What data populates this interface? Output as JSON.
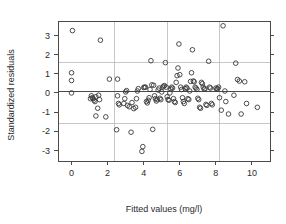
{
  "chart_data": {
    "type": "scatter",
    "title": "",
    "xlabel": "Fitted values (mg/l)",
    "ylabel": "Standardized residuals",
    "xlim": [
      -0.75,
      11.0
    ],
    "ylim": [
      -3.55,
      3.75
    ],
    "xticks": [
      0,
      2,
      4,
      6,
      8,
      10
    ],
    "xtick_labels": [
      "0",
      "2",
      "4",
      "6",
      "8",
      "10"
    ],
    "yticks": [
      -3,
      -2,
      -1,
      0,
      1,
      2,
      3
    ],
    "ytick_labels": [
      "-3",
      "-2",
      "-1",
      "0",
      "1",
      "2",
      "3"
    ],
    "grid": true,
    "grid_color": "#b9b9b9",
    "grid_x": [
      2.4,
      5.3,
      8.2
    ],
    "grid_y": [
      -1.6,
      1.6
    ],
    "reference_line": {
      "y": 0.1,
      "color": "#4a4a4a"
    },
    "marker": "open-circle",
    "marker_color": "#3a3a3a",
    "legend": null,
    "points": [
      [
        0.05,
        3.25
      ],
      [
        0.0,
        1.05
      ],
      [
        0.0,
        0.65
      ],
      [
        0.0,
        0.0
      ],
      [
        1.6,
        2.75
      ],
      [
        1.1,
        -0.15
      ],
      [
        1.15,
        -0.25
      ],
      [
        1.2,
        -0.3
      ],
      [
        1.25,
        -0.38
      ],
      [
        1.3,
        -0.45
      ],
      [
        1.05,
        -0.3
      ],
      [
        1.35,
        -0.2
      ],
      [
        1.5,
        -0.12
      ],
      [
        1.55,
        -0.35
      ],
      [
        1.45,
        -0.8
      ],
      [
        1.35,
        -1.2
      ],
      [
        1.9,
        -1.25
      ],
      [
        2.1,
        0.72
      ],
      [
        2.55,
        0.72
      ],
      [
        2.5,
        -1.92
      ],
      [
        2.55,
        -0.15
      ],
      [
        2.6,
        -0.55
      ],
      [
        2.65,
        -0.62
      ],
      [
        2.9,
        -0.55
      ],
      [
        2.95,
        -0.3
      ],
      [
        3.0,
        0.05
      ],
      [
        3.05,
        0.12
      ],
      [
        3.1,
        -0.65
      ],
      [
        3.2,
        -0.72
      ],
      [
        3.3,
        -2.05
      ],
      [
        3.35,
        -0.5
      ],
      [
        3.45,
        -0.82
      ],
      [
        3.55,
        -0.75
      ],
      [
        3.6,
        -0.3
      ],
      [
        3.65,
        0.1
      ],
      [
        3.7,
        0.22
      ],
      [
        3.9,
        -3.05
      ],
      [
        3.95,
        -2.8
      ],
      [
        4.0,
        0.28
      ],
      [
        4.05,
        0.3
      ],
      [
        4.1,
        0.3
      ],
      [
        4.15,
        -0.45
      ],
      [
        4.2,
        -0.52
      ],
      [
        4.25,
        -0.38
      ],
      [
        4.3,
        -0.25
      ],
      [
        4.35,
        0.18
      ],
      [
        4.4,
        1.68
      ],
      [
        4.45,
        0.42
      ],
      [
        4.5,
        -1.9
      ],
      [
        4.55,
        0.4
      ],
      [
        4.6,
        -0.15
      ],
      [
        4.65,
        -0.3
      ],
      [
        4.7,
        -0.42
      ],
      [
        4.75,
        -0.35
      ],
      [
        4.8,
        0.15
      ],
      [
        4.85,
        0.25
      ],
      [
        4.9,
        -0.28
      ],
      [
        4.95,
        -0.35
      ],
      [
        5.0,
        0.05
      ],
      [
        5.05,
        0.3
      ],
      [
        5.1,
        0.35
      ],
      [
        5.15,
        0.38
      ],
      [
        5.2,
        1.58
      ],
      [
        5.25,
        0.3
      ],
      [
        5.3,
        -0.2
      ],
      [
        5.35,
        -0.35
      ],
      [
        5.4,
        -0.38
      ],
      [
        5.45,
        0.0
      ],
      [
        5.5,
        0.2
      ],
      [
        5.55,
        0.3
      ],
      [
        5.6,
        0.25
      ],
      [
        5.65,
        -0.3
      ],
      [
        5.7,
        -0.45
      ],
      [
        5.75,
        -0.5
      ],
      [
        5.8,
        0.55
      ],
      [
        5.85,
        0.9
      ],
      [
        5.9,
        1.3
      ],
      [
        5.95,
        2.55
      ],
      [
        6.0,
        0.95
      ],
      [
        6.05,
        0.3
      ],
      [
        6.1,
        0.18
      ],
      [
        6.15,
        -0.25
      ],
      [
        6.2,
        -0.45
      ],
      [
        6.25,
        -0.55
      ],
      [
        6.3,
        0.22
      ],
      [
        6.35,
        0.3
      ],
      [
        6.4,
        0.25
      ],
      [
        6.45,
        -0.3
      ],
      [
        6.5,
        -0.35
      ],
      [
        6.55,
        0.1
      ],
      [
        6.6,
        0.6
      ],
      [
        6.65,
        1.05
      ],
      [
        6.7,
        2.25
      ],
      [
        6.75,
        0.62
      ],
      [
        6.8,
        0.58
      ],
      [
        6.85,
        0.3
      ],
      [
        6.9,
        0.25
      ],
      [
        6.95,
        0.18
      ],
      [
        7.0,
        -0.28
      ],
      [
        7.05,
        -0.35
      ],
      [
        7.1,
        -0.75
      ],
      [
        7.15,
        -0.8
      ],
      [
        7.2,
        0.55
      ],
      [
        7.25,
        0.48
      ],
      [
        7.3,
        0.3
      ],
      [
        7.35,
        0.2
      ],
      [
        7.4,
        0.22
      ],
      [
        7.45,
        -0.6
      ],
      [
        7.5,
        -0.65
      ],
      [
        7.6,
        1.65
      ],
      [
        7.65,
        0.3
      ],
      [
        7.7,
        0.25
      ],
      [
        7.75,
        -0.55
      ],
      [
        7.8,
        -0.62
      ],
      [
        8.0,
        0.25
      ],
      [
        8.05,
        0.2
      ],
      [
        8.1,
        0.22
      ],
      [
        8.15,
        0.3
      ],
      [
        8.2,
        -0.25
      ],
      [
        8.3,
        -0.9
      ],
      [
        8.4,
        3.5
      ],
      [
        8.5,
        0.1
      ],
      [
        8.55,
        -0.45
      ],
      [
        8.7,
        -1.1
      ],
      [
        9.0,
        -0.12
      ],
      [
        9.1,
        1.55
      ],
      [
        9.2,
        0.7
      ],
      [
        9.3,
        0.62
      ],
      [
        9.4,
        -1.1
      ],
      [
        9.6,
        0.58
      ],
      [
        9.7,
        -0.55
      ],
      [
        10.3,
        -0.75
      ]
    ]
  }
}
